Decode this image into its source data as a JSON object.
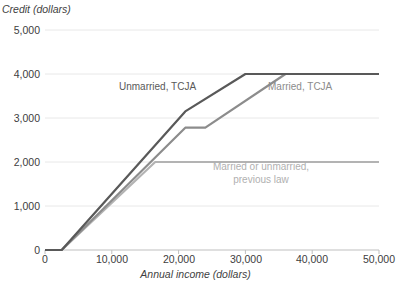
{
  "chart_data": {
    "type": "line",
    "title": "",
    "xlabel": "Annual income (dollars)",
    "ylabel": "Credit (dollars)",
    "xlim": [
      0,
      50000
    ],
    "ylim": [
      0,
      5000
    ],
    "grid": true,
    "legend_position": "inline-annotations",
    "x_ticks": [
      "0",
      "10,000",
      "20,000",
      "30,000",
      "40,000",
      "50,000"
    ],
    "x_tick_values": [
      0,
      10000,
      20000,
      30000,
      40000,
      50000
    ],
    "y_ticks": [
      "0",
      "1,000",
      "2,000",
      "3,000",
      "4,000",
      "5,000"
    ],
    "y_tick_values": [
      0,
      1000,
      2000,
      3000,
      4000,
      5000
    ],
    "series": [
      {
        "name": "Unmarried, TCJA",
        "color": "#595959",
        "points": [
          [
            0,
            0
          ],
          [
            2500,
            0
          ],
          [
            21000,
            3150
          ],
          [
            30000,
            4000
          ],
          [
            50000,
            4000
          ]
        ]
      },
      {
        "name": "Married, TCJA",
        "color": "#8c8c8c",
        "points": [
          [
            0,
            0
          ],
          [
            2500,
            0
          ],
          [
            21000,
            2780
          ],
          [
            24000,
            2780
          ],
          [
            36000,
            4000
          ],
          [
            50000,
            4000
          ]
        ]
      },
      {
        "name": "Married or unmarried, previous law",
        "color": "#b3b3b3",
        "points": [
          [
            0,
            0
          ],
          [
            2500,
            0
          ],
          [
            16500,
            2000
          ],
          [
            50000,
            2000
          ]
        ]
      }
    ]
  },
  "axes": {
    "y_title": "Credit (dollars)",
    "x_title": "Annual income (dollars)",
    "y_tick_labels": [
      "5,000",
      "4,000",
      "3,000",
      "2,000",
      "1,000",
      "0"
    ],
    "x_tick_labels": [
      "0",
      "10,000",
      "20,000",
      "30,000",
      "40,000",
      "50,000"
    ]
  },
  "annotations": {
    "unmarried_tcja": "Unmarried, TCJA",
    "married_tcja": "Married, TCJA",
    "previous_law_line1": "Married or unmarried,",
    "previous_law_line2": "previous law"
  },
  "colors": {
    "unmarried_tcja": "#595959",
    "married_tcja": "#8c8c8c",
    "previous_law": "#b3b3b3",
    "gridline": "#e8e8e8",
    "axis": "#bfbfbf",
    "text": "#404040"
  }
}
